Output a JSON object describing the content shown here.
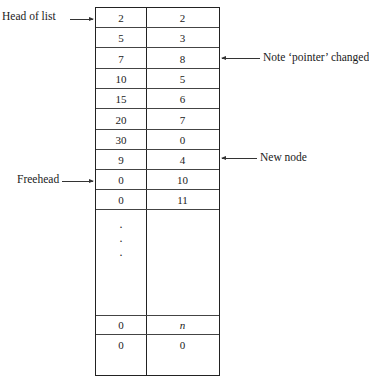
{
  "labels": {
    "head_of_list": "Head of list",
    "freehead": "Freehead",
    "pointer_changed": "Note ‘pointer’ changed",
    "new_node": "New node"
  },
  "table": {
    "rows": [
      {
        "value": "2",
        "pointer": "2"
      },
      {
        "value": "5",
        "pointer": "3"
      },
      {
        "value": "7",
        "pointer": "8"
      },
      {
        "value": "10",
        "pointer": "5"
      },
      {
        "value": "15",
        "pointer": "6"
      },
      {
        "value": "20",
        "pointer": "7"
      },
      {
        "value": "30",
        "pointer": "0"
      },
      {
        "value": "9",
        "pointer": "4"
      },
      {
        "value": "0",
        "pointer": "10"
      },
      {
        "value": "0",
        "pointer": "11"
      }
    ],
    "ellipsis": "·",
    "tail_rows": [
      {
        "value": "0",
        "pointer": "n"
      },
      {
        "value": "0",
        "pointer": "0"
      }
    ]
  }
}
